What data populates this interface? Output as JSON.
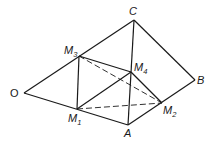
{
  "figure": {
    "points": [
      {
        "id": "O",
        "label": "O",
        "sub": ""
      },
      {
        "id": "A",
        "label": "A",
        "sub": ""
      },
      {
        "id": "B",
        "label": "B",
        "sub": ""
      },
      {
        "id": "C",
        "label": "C",
        "sub": ""
      },
      {
        "id": "M1",
        "label": "M",
        "sub": "1"
      },
      {
        "id": "M2",
        "label": "M",
        "sub": "2"
      },
      {
        "id": "M3",
        "label": "M",
        "sub": "3"
      },
      {
        "id": "M4",
        "label": "M",
        "sub": "4"
      }
    ],
    "edges": [
      {
        "from": "O",
        "to": "C",
        "style": "solid"
      },
      {
        "from": "C",
        "to": "B",
        "style": "solid"
      },
      {
        "from": "B",
        "to": "A",
        "style": "solid"
      },
      {
        "from": "A",
        "to": "O",
        "style": "solid"
      },
      {
        "from": "C",
        "to": "A",
        "style": "solid"
      },
      {
        "from": "M3",
        "to": "M1",
        "style": "solid"
      },
      {
        "from": "M3",
        "to": "M4",
        "style": "solid"
      },
      {
        "from": "M4",
        "to": "M2",
        "style": "solid"
      },
      {
        "from": "M1",
        "to": "M4",
        "style": "solid"
      },
      {
        "from": "M3",
        "to": "M2",
        "style": "dashed"
      },
      {
        "from": "M1",
        "to": "M2",
        "style": "dashed"
      }
    ]
  }
}
